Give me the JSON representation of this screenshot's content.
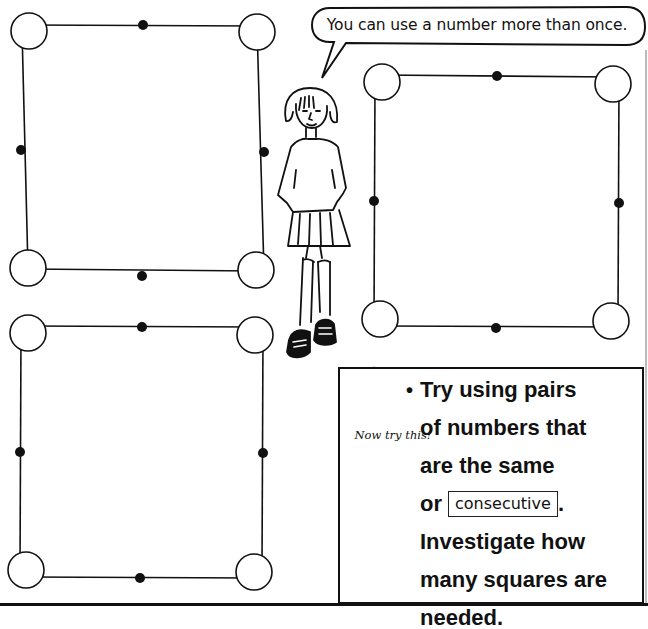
{
  "speech_bubble": {
    "text": "You can use a number more than once."
  },
  "puzzles": [
    {
      "name": "top-left",
      "corners": 4,
      "midpoints": 4
    },
    {
      "name": "top-right",
      "corners": 4,
      "midpoints": 4
    },
    {
      "name": "bottom-left",
      "corners": 4,
      "midpoints": 4
    }
  ],
  "challenge": {
    "sign_label": "Now try this!",
    "bullet": "•",
    "lines": {
      "l1": "Try using pairs",
      "l2": "of numbers that",
      "l3": "are the same",
      "l4_prefix": "or",
      "l4_box": "consecutive",
      "l4_suffix": ".",
      "l5": "Investigate how",
      "l6": "many squares are",
      "l7": "needed."
    }
  },
  "colors": {
    "ink": "#111111",
    "paper": "#ffffff"
  }
}
